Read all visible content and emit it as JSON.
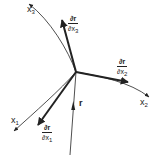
{
  "diagram": {
    "type": "curvilinear-coordinate-basis",
    "origin": {
      "x": 76,
      "y": 72
    },
    "axes": [
      {
        "name": "x1",
        "label": "x",
        "subscript": "1",
        "curve_end": {
          "x": 14,
          "y": 131
        }
      },
      {
        "name": "x2",
        "label": "x",
        "subscript": "2",
        "curve_end": {
          "x": 149,
          "y": 97
        }
      },
      {
        "name": "x3",
        "label": "x",
        "subscript": "3",
        "curve_end": {
          "x": 29,
          "y": 4
        }
      }
    ],
    "tangent_vectors": [
      {
        "name": "dr_dx1",
        "numerator": "∂r",
        "denominator_var": "∂x",
        "denominator_sub": "1",
        "tip": {
          "x": 38,
          "y": 125
        }
      },
      {
        "name": "dr_dx2",
        "numerator": "∂r",
        "denominator_var": "∂x",
        "denominator_sub": "2",
        "tip": {
          "x": 128,
          "y": 82
        }
      },
      {
        "name": "dr_dx3",
        "numerator": "∂r",
        "denominator_var": "∂x",
        "denominator_sub": "3",
        "tip": {
          "x": 62,
          "y": 20
        }
      }
    ],
    "position_vector": {
      "label": "r",
      "tail": {
        "x": 70,
        "y": 155
      },
      "head": {
        "x": 76,
        "y": 72
      }
    }
  },
  "labels": {
    "x1": {
      "base": "x",
      "sub": "1"
    },
    "x2": {
      "base": "x",
      "sub": "2"
    },
    "x3": {
      "base": "x",
      "sub": "3"
    },
    "r": "r",
    "dr1": {
      "num": "∂r",
      "den": "∂x",
      "sub": "1"
    },
    "dr2": {
      "num": "∂r",
      "den": "∂x",
      "sub": "2"
    },
    "dr3": {
      "num": "∂r",
      "den": "∂x",
      "sub": "3"
    }
  },
  "colors": {
    "stroke": "#222222",
    "background": "#ffffff"
  }
}
